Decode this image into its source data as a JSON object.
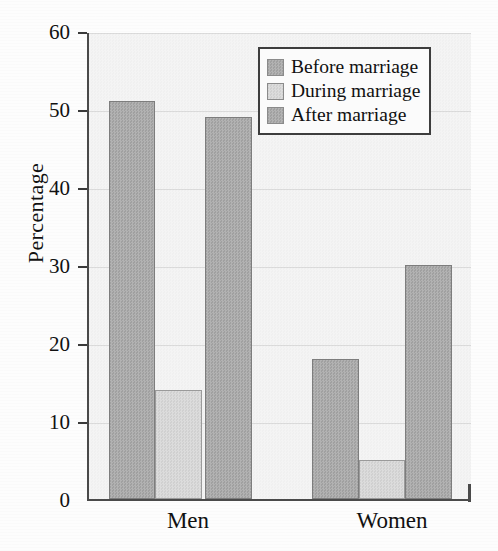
{
  "chart_data": {
    "type": "bar",
    "title": "",
    "subtitle": "",
    "xlabel": "",
    "ylabel": "Percentage",
    "categories": [
      "Men",
      "Women"
    ],
    "series": [
      {
        "name": "Before marriage",
        "values": [
          51,
          18
        ],
        "color": "#a8a8a8"
      },
      {
        "name": "During marriage",
        "values": [
          14,
          5
        ],
        "color": "#d4d4d4"
      },
      {
        "name": "After marriage",
        "values": [
          49,
          30
        ],
        "color": "#a8a8a8"
      }
    ],
    "ylim": [
      0,
      60
    ],
    "yticks": [
      0,
      10,
      20,
      30,
      40,
      50,
      60
    ],
    "ytick_labels": [
      "0",
      "10",
      "20",
      "30",
      "40",
      "50",
      "60"
    ],
    "grid": "horizontal-faint",
    "legend_position": "top-right",
    "legend_border": true,
    "bar_grouping": "adjacent-within-group",
    "annotations": []
  },
  "axis": {
    "y_title": "Percentage",
    "ticks": [
      {
        "value": 60,
        "label": "60"
      },
      {
        "value": 50,
        "label": "50"
      },
      {
        "value": 40,
        "label": "40"
      },
      {
        "value": 30,
        "label": "30"
      },
      {
        "value": 20,
        "label": "20"
      },
      {
        "value": 10,
        "label": "10"
      },
      {
        "value": 0,
        "label": "0"
      }
    ],
    "x_categories": [
      {
        "label": "Men"
      },
      {
        "label": "Women"
      }
    ]
  },
  "legend": {
    "items": [
      {
        "label": "Before marriage",
        "swatch": "dark"
      },
      {
        "label": "During marriage",
        "swatch": "light"
      },
      {
        "label": "After marriage",
        "swatch": "dark"
      }
    ]
  },
  "colors": {
    "bar_dark": "#a8a8a8",
    "bar_light": "#d4d4d4",
    "bar_outline": "#8e8e8e",
    "axis": "#4a4a4a",
    "plot_background": "#f2f2f2",
    "text": "#111111"
  }
}
